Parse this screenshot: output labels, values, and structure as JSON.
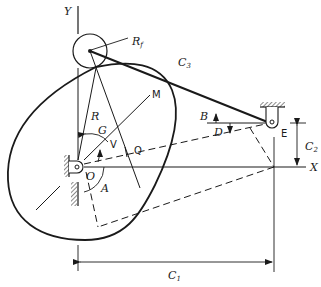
{
  "diagram": {
    "type": "cam-follower mechanism",
    "labels": {
      "y_axis": "Y",
      "x_axis": "X",
      "roller_radius": "R",
      "roller_radius_sub": "f",
      "link": "C",
      "link_sub": "3",
      "angle_b": "B",
      "angle_d": "D",
      "pivot_e": "E",
      "dim_c2": "C",
      "dim_c2_sub": "2",
      "dim_c1": "C",
      "dim_c1_sub": "1",
      "line_m": "M",
      "radius_r": "R",
      "angle_g": "G",
      "line_v": "V",
      "line_q": "Q",
      "center_o": "O",
      "angle_a": "A"
    },
    "colors": {
      "line": "#1a1a1a",
      "background": "#ffffff"
    }
  }
}
